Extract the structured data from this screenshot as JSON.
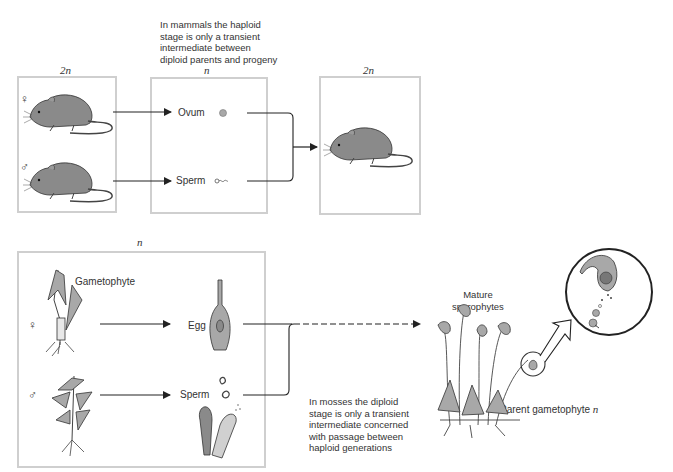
{
  "mammal": {
    "note_lines": [
      "In mammals the haploid",
      "stage is only a transient",
      "intermediate between",
      "diploid parents and progeny"
    ],
    "parents_ploidy": "2n",
    "gametes_ploidy": "n",
    "progeny_ploidy": "2n",
    "female_symbol": "♀",
    "male_symbol": "♂",
    "ovum_label": "Ovum",
    "sperm_label": "Sperm"
  },
  "moss": {
    "box_ploidy": "n",
    "gametophyte_label": "Gametophyte",
    "female_symbol": "♀",
    "male_symbol": "♂",
    "egg_label": "Egg",
    "sperm_label": "Sperm",
    "note_lines": [
      "In mosses the diploid",
      "stage is only a transient",
      "intermediate concerned",
      "with passage between",
      "haploid generations"
    ],
    "mature_sporophytes_lines": [
      "Mature",
      "sporophytes"
    ],
    "parent_gametophyte_label": "Parent gametophyte",
    "parent_gametophyte_ploidy": "n",
    "inset_ploidy": "2n",
    "spores_label": "Spores",
    "spores_ploidy": "n"
  },
  "colors": {
    "box_border": "#cfcfcf",
    "line": "#222222",
    "fill_gray": "#a8a8a8",
    "text": "#333333"
  }
}
